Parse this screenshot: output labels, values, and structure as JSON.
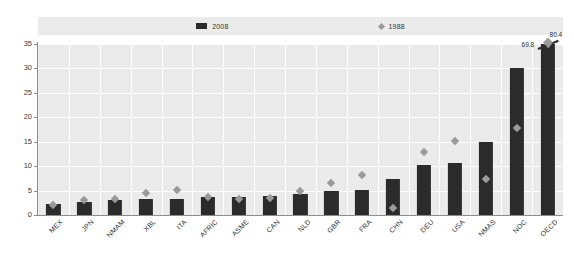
{
  "chart_data": {
    "type": "bar",
    "title": "",
    "subtitle": "",
    "xlabel": "",
    "ylabel": "",
    "ylim": [
      0,
      35
    ],
    "ytick_values": [
      0,
      5,
      10,
      15,
      20,
      25,
      30,
      35
    ],
    "ytick_labels": [
      "0",
      "5",
      "10",
      "15",
      "20",
      "25",
      "30",
      "35"
    ],
    "grid": true,
    "legend_position": "top",
    "categories": [
      "MEX",
      "JPN",
      "NMAM",
      "XBL",
      "ITA",
      "AFRIC",
      "ASME",
      "CAN",
      "NLD",
      "GBR",
      "FRA",
      "CHN",
      "DEU",
      "USA",
      "NMAS",
      "NOC",
      "OECD"
    ],
    "series": [
      {
        "name": "2008",
        "type": "bar",
        "color": "#2b2b2b",
        "marker": "square",
        "values": [
          2.2,
          2.6,
          3.0,
          3.2,
          3.3,
          3.6,
          3.7,
          3.9,
          4.2,
          5.0,
          5.2,
          7.4,
          10.3,
          10.7,
          14.9,
          30.0,
          69.8
        ]
      },
      {
        "name": "1988",
        "type": "scatter",
        "color": "#9a9a9a",
        "marker": "diamond",
        "values": [
          2.0,
          3.1,
          3.2,
          4.5,
          5.2,
          3.6,
          3.3,
          3.5,
          5.0,
          6.6,
          8.1,
          1.5,
          12.8,
          15.1,
          7.4,
          17.9,
          80.4
        ]
      }
    ],
    "annotations": [
      {
        "text": "80.4",
        "series": "1988",
        "category": "OECD",
        "value": 80.4
      },
      {
        "text": "69.8",
        "series": "2008",
        "category": "OECD",
        "value": 69.8
      }
    ]
  },
  "legend": {
    "entries": [
      {
        "label": "2008",
        "marker": "square-marker-icon",
        "color": "#2b2b2b"
      },
      {
        "label": "1988",
        "marker": "diamond-marker-icon",
        "color": "#9a9a9a"
      }
    ]
  }
}
